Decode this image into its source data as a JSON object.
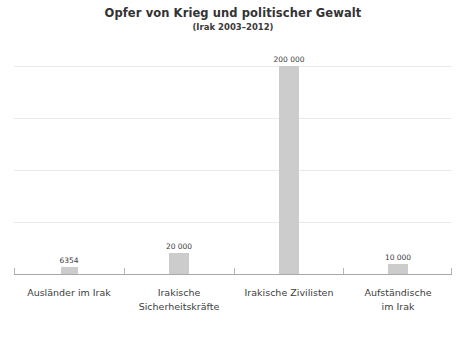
{
  "chart_data": {
    "type": "bar",
    "title": "Opfer von Krieg und politischer Gewalt",
    "subtitle": "(Irak 2003–2012)",
    "xlabel": "",
    "ylabel": "",
    "ylim": [
      0,
      200000
    ],
    "grid": true,
    "legend": "none",
    "orientation": "vertical",
    "bar_color": "#cccccc",
    "gridline_color": "#eaeaea",
    "axis_color": "#a8a8a8",
    "gridline_values": [
      50000,
      100000,
      150000,
      200000
    ],
    "categories": [
      "Ausländer im Irak",
      "Irakische\nSicherheitskräfte",
      "Irakische Zivilisten",
      "Aufständische\nim Irak"
    ],
    "values": [
      6354,
      20000,
      200000,
      10000
    ],
    "value_labels": [
      "6354",
      "20 000",
      "200 000",
      "10 000"
    ]
  }
}
